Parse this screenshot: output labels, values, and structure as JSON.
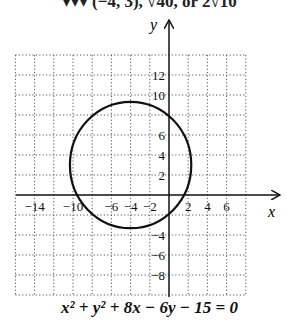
{
  "header": {
    "clipped_text": "▾▾▾ (−4, 3), √40, or 2√10"
  },
  "caption": {
    "equation": "x² + y² + 8x − 6y − 15 = 0"
  },
  "colors": {
    "axis": "#111111",
    "grid": "#555555",
    "curve": "#111111"
  },
  "chart_data": {
    "type": "line",
    "title": "",
    "xlabel": "x",
    "ylabel": "y",
    "xlim": [
      -16,
      8
    ],
    "ylim": [
      -10,
      14
    ],
    "grid": true,
    "grid_step": 2,
    "x_tick_labels": [
      "-14",
      "-10",
      "-6",
      "-4",
      "-2",
      "2",
      "4",
      "6"
    ],
    "y_tick_labels": [
      "12",
      "10",
      "6",
      "4",
      "2",
      "-4",
      "-6",
      "-8"
    ],
    "series": [
      {
        "name": "circle",
        "shape": "circle",
        "center": [
          -4,
          3
        ],
        "radius": 6.32,
        "equation": "x^2 + y^2 + 8x - 6y - 15 = 0"
      }
    ]
  }
}
